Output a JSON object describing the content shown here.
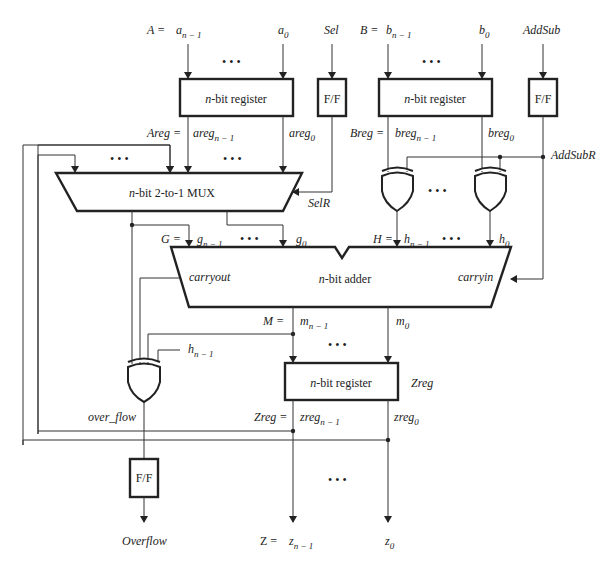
{
  "inputs": {
    "a_eq": "A =",
    "a_msb": "a",
    "a_msb_sub": "n − 1",
    "a_lsb": "a",
    "a_lsb_sub": "0",
    "sel": "Sel",
    "b_eq": "B =",
    "b_msb": "b",
    "b_msb_sub": "n − 1",
    "b_lsb": "b",
    "b_lsb_sub": "0",
    "addsub": "AddSub"
  },
  "blocks": {
    "reg_a": {
      "prefix": "n",
      "label": "-bit register"
    },
    "reg_b": {
      "prefix": "n",
      "label": "-bit register"
    },
    "ff_sel": {
      "label": "F/F"
    },
    "ff_addsub": {
      "label": "F/F"
    },
    "mux": {
      "prefix": "n",
      "label": "-bit 2-to-1 MUX"
    },
    "adder": {
      "prefix": "n",
      "label": "-bit adder"
    },
    "reg_z": {
      "prefix": "n",
      "label": "-bit register"
    },
    "ff_overflow": {
      "label": "F/F"
    }
  },
  "signals": {
    "areg_eq": "Areg =",
    "areg_msb": "areg",
    "areg_msb_sub": "n − 1",
    "areg_lsb": "areg",
    "areg_lsb_sub": "0",
    "breg_eq": "Breg =",
    "breg_msb": "breg",
    "breg_msb_sub": "n − 1",
    "breg_lsb": "breg",
    "breg_lsb_sub": "0",
    "addsubr": "AddSubR",
    "selr": "SelR",
    "g_eq": "G =",
    "g_msb": "g",
    "g_msb_sub": "n − 1",
    "g_lsb": "g",
    "g_lsb_sub": "0",
    "h_eq": "H =",
    "h_msb": "h",
    "h_msb_sub": "n − 1",
    "h_lsb": "h",
    "h_lsb_sub": "0",
    "carryout": "carryout",
    "carryin": "carryin",
    "m_eq": "M =",
    "m_msb": "m",
    "m_msb_sub": "n − 1",
    "m_lsb": "m",
    "m_lsb_sub": "0",
    "h_xor": "h",
    "h_xor_sub": "n − 1",
    "zreg_name": "Zreg",
    "zreg_eq": "Zreg =",
    "zreg_msb": "zreg",
    "zreg_msb_sub": "n − 1",
    "zreg_lsb": "zreg",
    "zreg_lsb_sub": "0",
    "over_flow": "over_flow"
  },
  "outputs": {
    "overflow": "Overflow",
    "z_eq": "Z =",
    "z_msb": "z",
    "z_msb_sub": "n − 1",
    "z_lsb": "z",
    "z_lsb_sub": "0"
  },
  "ellipsis": "• • •"
}
